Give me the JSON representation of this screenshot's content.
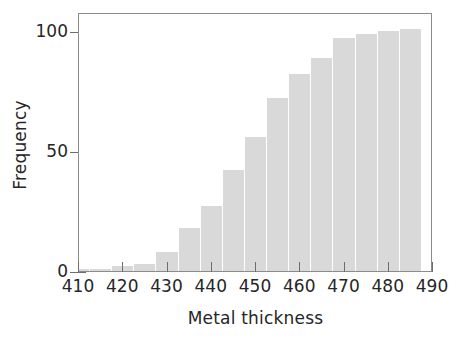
{
  "chart_data": {
    "type": "bar",
    "title": "",
    "subtitle": "",
    "xlabel": "Metal thickness",
    "ylabel": "Frequency",
    "xlim": [
      410,
      490
    ],
    "ylim": [
      0,
      108
    ],
    "xticks": [
      410,
      420,
      430,
      440,
      450,
      460,
      470,
      480,
      490
    ],
    "xtick_labels": [
      "410",
      "420",
      "430",
      "440",
      "450",
      "460",
      "470",
      "480",
      "490"
    ],
    "yticks": [
      0,
      50,
      100
    ],
    "ytick_labels": [
      "0",
      "50",
      "100"
    ],
    "grid": false,
    "legend": null,
    "bar_color": "#d9d9d9",
    "bar_edge_color": "#ffffff",
    "axis_color": "#8c8c8c",
    "text_color": "#262626",
    "bin_width": 5,
    "bin_starts": [
      407.5,
      412.5,
      417.5,
      422.5,
      427.5,
      432.5,
      437.5,
      442.5,
      447.5,
      452.5,
      457.5,
      462.5,
      467.5,
      472.5,
      477.5,
      482.5
    ],
    "categories": [
      "407.5-412.5",
      "412.5-417.5",
      "417.5-422.5",
      "422.5-427.5",
      "427.5-432.5",
      "432.5-437.5",
      "437.5-442.5",
      "442.5-447.5",
      "447.5-452.5",
      "452.5-457.5",
      "457.5-462.5",
      "462.5-467.5",
      "467.5-472.5",
      "472.5-477.5",
      "477.5-482.5",
      "482.5-487.5"
    ],
    "values": [
      1,
      1,
      2,
      3,
      8,
      18,
      27,
      42,
      56,
      72,
      82,
      89,
      97,
      99,
      100,
      101
    ]
  }
}
